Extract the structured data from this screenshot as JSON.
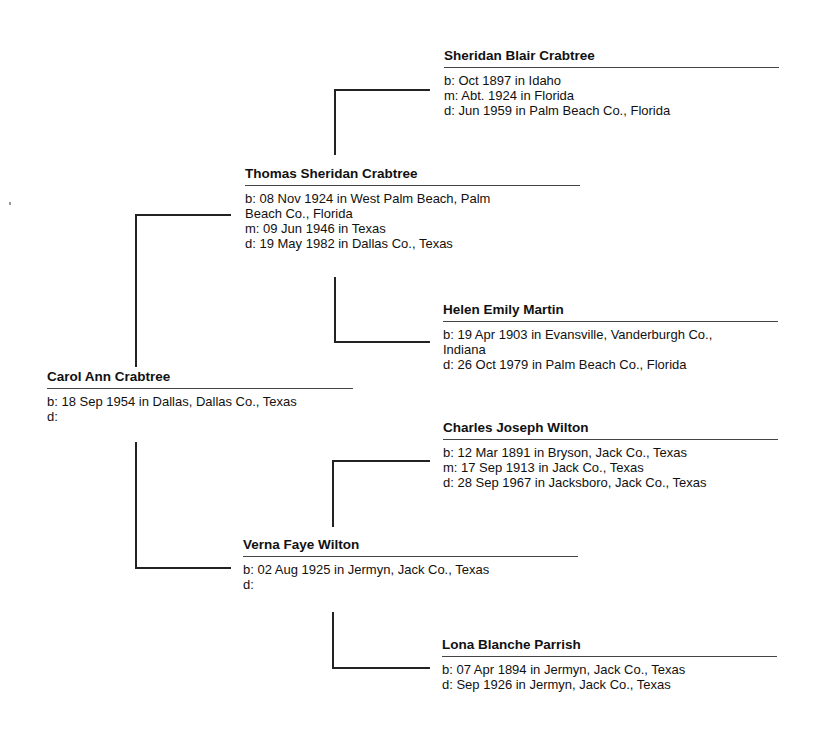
{
  "chart": {
    "type": "pedigree",
    "root": {
      "name": "Carol Ann Crabtree",
      "facts": [
        "b: 18 Sep 1954 in Dallas, Dallas Co., Texas",
        "d:"
      ]
    },
    "father": {
      "name": "Thomas Sheridan Crabtree",
      "facts": [
        "b: 08 Nov 1924 in West Palm Beach, Palm",
        "Beach Co., Florida",
        "m: 09 Jun 1946 in Texas",
        "d: 19 May 1982 in Dallas Co., Texas"
      ]
    },
    "mother": {
      "name": "Verna Faye Wilton",
      "facts": [
        "b: 02 Aug 1925 in Jermyn, Jack Co., Texas",
        "d:"
      ]
    },
    "paternal_grandfather": {
      "name": "Sheridan Blair Crabtree",
      "facts": [
        "b: Oct 1897 in Idaho",
        "m: Abt. 1924 in Florida",
        "d: Jun 1959 in Palm Beach Co., Florida"
      ]
    },
    "paternal_grandmother": {
      "name": "Helen Emily Martin",
      "facts": [
        "b: 19 Apr 1903 in Evansville, Vanderburgh Co.,",
        "Indiana",
        "d: 26 Oct 1979 in Palm Beach Co., Florida"
      ]
    },
    "maternal_grandfather": {
      "name": "Charles Joseph Wilton",
      "facts": [
        "b: 12 Mar 1891 in Bryson, Jack Co., Texas",
        "m: 17 Sep 1913 in Jack Co., Texas",
        "d: 28 Sep 1967 in Jacksboro, Jack Co., Texas"
      ]
    },
    "maternal_grandmother": {
      "name": "Lona Blanche Parrish",
      "facts": [
        "b: 07 Apr 1894 in Jermyn, Jack Co., Texas",
        "d: Sep 1926 in Jermyn, Jack Co., Texas"
      ]
    }
  }
}
